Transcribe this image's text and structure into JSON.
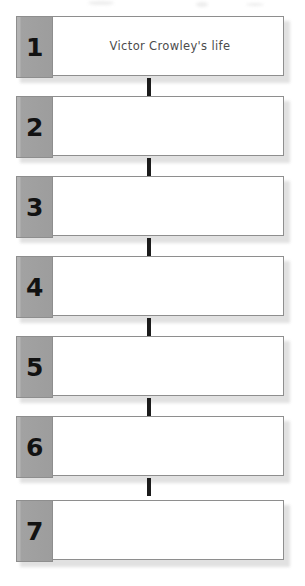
{
  "document": {
    "type": "sequence-chart-worksheet",
    "title": "Victor Crowley's life",
    "step_count": 7
  },
  "colors": {
    "number_tab_bg": "#a2a2a2",
    "panel_bg": "#ffffff",
    "border": "#8e8e8e",
    "connector": "#1b1b1b",
    "number_text": "#121212",
    "body_text": "#4c4c4c"
  },
  "steps": [
    {
      "number": "1",
      "text": "Victor Crowley's life"
    },
    {
      "number": "2",
      "text": ""
    },
    {
      "number": "3",
      "text": ""
    },
    {
      "number": "4",
      "text": ""
    },
    {
      "number": "5",
      "text": ""
    },
    {
      "number": "6",
      "text": ""
    },
    {
      "number": "7",
      "text": ""
    }
  ]
}
